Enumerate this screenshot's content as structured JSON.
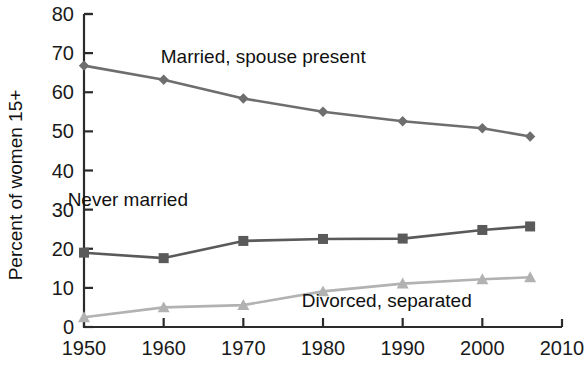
{
  "chart_data": {
    "type": "line",
    "title": "",
    "subtitle": "",
    "xlabel": "",
    "ylabel": "Percent of women 15+",
    "xlim": [
      1950,
      2010
    ],
    "ylim": [
      0,
      80
    ],
    "yticks": [
      0,
      10,
      20,
      30,
      40,
      50,
      60,
      70,
      80
    ],
    "xticks": [
      1950,
      1960,
      1970,
      1980,
      1990,
      2000,
      2010
    ],
    "xticklabels": [
      "1950",
      "1960",
      "1970",
      "1980",
      "1990",
      "2000",
      "2010"
    ],
    "yticklabels": [
      "0",
      "10",
      "20",
      "30",
      "40",
      "50",
      "60",
      "70",
      "80"
    ],
    "grid": false,
    "legend_position": "inline-annotations",
    "x": [
      1950,
      1960,
      1970,
      1980,
      1990,
      2000,
      2006
    ],
    "series": [
      {
        "name": "Married, spouse present",
        "marker": "diamond",
        "color": "#6e6e6e",
        "values": [
          66.8,
          63.2,
          58.4,
          55.0,
          52.6,
          50.8,
          48.7
        ],
        "annotation": "Married, spouse present"
      },
      {
        "name": "Never married",
        "marker": "square",
        "color": "#5a5a5a",
        "values": [
          19.0,
          17.6,
          22.0,
          22.5,
          22.6,
          24.8,
          25.7
        ],
        "annotation": "Never married"
      },
      {
        "name": "Divorced, separated",
        "marker": "triangle",
        "color": "#b2b2b2",
        "values": [
          2.5,
          5.0,
          5.6,
          9.1,
          11.1,
          12.2,
          12.7
        ],
        "annotation": "Divorced, separated"
      }
    ],
    "annotations": [
      {
        "text": "Married, spouse present",
        "x": 1972.5,
        "y": 67.5
      },
      {
        "text": "Never married",
        "x": 1955.5,
        "y": 31.0
      },
      {
        "text": "Divorced, separated",
        "x": 1988.0,
        "y": 5.0
      }
    ]
  },
  "axes": {
    "y_title": "Percent of women 15+"
  }
}
